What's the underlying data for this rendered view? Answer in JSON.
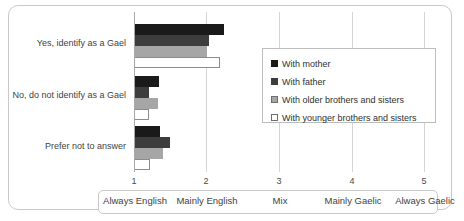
{
  "chart_data": {
    "type": "bar",
    "orientation": "horizontal",
    "title": "",
    "xlabel": "",
    "ylabel": "",
    "xlim": [
      1,
      5
    ],
    "grid": true,
    "legend_position": "right-inside",
    "categories": [
      "Yes, identify as a Gael",
      "No, do not identify as a Gael",
      "Prefer not to answer"
    ],
    "x_ticks": [
      {
        "value": "1",
        "label": "Always English"
      },
      {
        "value": "2",
        "label": "Mainly English"
      },
      {
        "value": "3",
        "label": "Mix"
      },
      {
        "value": "4",
        "label": "Mainly Gaelic"
      },
      {
        "value": "5",
        "label": "Always Gaelic"
      }
    ],
    "series": [
      {
        "name": "With mother",
        "color": "#1a1a1a",
        "values": [
          2.24,
          1.35,
          1.36
        ]
      },
      {
        "name": "With father",
        "color": "#3d3d3d",
        "values": [
          2.03,
          1.2,
          1.5
        ]
      },
      {
        "name": "With older brothers and sisters",
        "color": "#a6a6a6",
        "values": [
          2.0,
          1.33,
          1.4
        ]
      },
      {
        "name": "With younger brothers and sisters",
        "color": "#ffffff",
        "values": [
          2.18,
          1.21,
          1.22
        ]
      }
    ]
  }
}
